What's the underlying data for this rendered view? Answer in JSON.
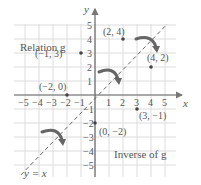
{
  "figure": {
    "title_relation": "Relation g",
    "title_inverse": "Inverse of g",
    "line_label": "y = x",
    "axis_x_label": "x",
    "axis_y_label": "y",
    "x_ticks": [
      "−5",
      "−4",
      "−3",
      "−2",
      "−1",
      "1",
      "2",
      "3",
      "4",
      "5"
    ],
    "y_ticks": [
      "5",
      "4",
      "3",
      "2",
      "1",
      "−1",
      "−2",
      "−3",
      "−4",
      "−5"
    ]
  },
  "chart_data": {
    "type": "scatter",
    "title": "",
    "xlabel": "x",
    "ylabel": "y",
    "xlim": [
      -5,
      5
    ],
    "ylim": [
      -5,
      5
    ],
    "grid": true,
    "series": [
      {
        "name": "Relation g",
        "points": [
          [
            -1,
            3
          ],
          [
            2,
            4
          ],
          [
            -2,
            0
          ]
        ],
        "labels": [
          "(−1, 3)",
          "(2, 4)",
          "(−2, 0)"
        ]
      },
      {
        "name": "Inverse of g",
        "points": [
          [
            3,
            -1
          ],
          [
            4,
            2
          ],
          [
            0,
            -2
          ]
        ],
        "labels": [
          "(3, −1)",
          "(4, 2)",
          "(0, −2)"
        ]
      }
    ],
    "reference_line": {
      "label": "y = x",
      "style": "dashed"
    },
    "annotations": [
      "Relation g",
      "Inverse of g",
      "reflection arrows across y = x"
    ]
  }
}
